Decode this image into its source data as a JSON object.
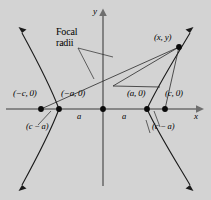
{
  "figure": {
    "background_color": "#d3d3d3",
    "axes": {
      "x_label": "x",
      "y_label": "y",
      "axis_color": "#6e6e6e"
    },
    "annotation": {
      "line1": "Focal",
      "line2": "radii"
    },
    "points": [
      {
        "id": "left-focus",
        "label": "(−c, 0)",
        "x": 41,
        "y": 109
      },
      {
        "id": "left-vertex",
        "label": "(−a, 0)",
        "x": 59,
        "y": 109
      },
      {
        "id": "origin",
        "label": "",
        "x": 103,
        "y": 109
      },
      {
        "id": "right-vertex",
        "label": "(a, 0)",
        "x": 147,
        "y": 109
      },
      {
        "id": "right-focus",
        "label": "(c, 0)",
        "x": 165,
        "y": 109
      },
      {
        "id": "curve-point",
        "label": "(x, y)",
        "x": 179,
        "y": 47
      }
    ],
    "segment_labels": {
      "a_left": "a",
      "a_right": "a",
      "c_minus_a_left": "(c − a)",
      "c_minus_a_right": "(c − a)"
    },
    "curve_color": "#1a1a1a"
  }
}
